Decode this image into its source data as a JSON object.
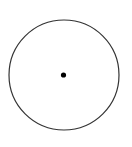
{
  "diagram": {
    "shape": "circle-with-center-point",
    "circle": {
      "cx": 64,
      "cy": 75,
      "r": 55,
      "stroke": "#333333",
      "stroke_width": 1.2,
      "fill": "none"
    },
    "center_point": {
      "cx": 63.5,
      "cy": 75,
      "r": 2.6,
      "fill": "#000000"
    }
  },
  "colors": {
    "background": "#ffffff",
    "stroke": "#333333",
    "point": "#000000"
  }
}
